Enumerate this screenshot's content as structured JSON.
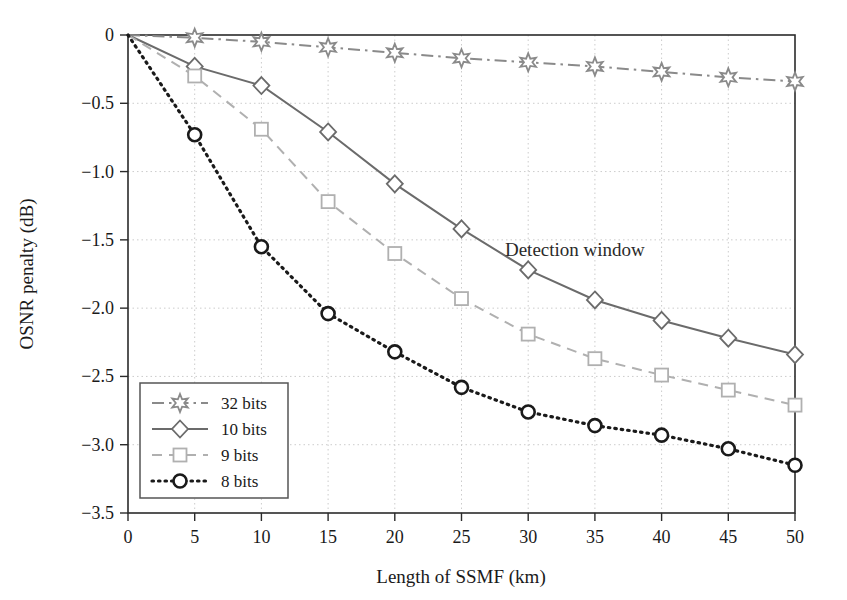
{
  "chart_data": {
    "type": "line",
    "title": "",
    "xlabel": "Length of SSMF (km)",
    "ylabel": "OSNR penalty (dB)",
    "xlim": [
      0,
      50
    ],
    "ylim": [
      -3.5,
      0
    ],
    "xticks": [
      "0",
      "5",
      "10",
      "15",
      "20",
      "25",
      "30",
      "35",
      "40",
      "45",
      "50"
    ],
    "yticks": [
      "0",
      "−0.5",
      "−1.0",
      "−1.5",
      "−2.0",
      "−2.5",
      "−3.0",
      "−3.5"
    ],
    "ytick_values": [
      0,
      -0.5,
      -1.0,
      -1.5,
      -2.0,
      -2.5,
      -3.0,
      -3.5
    ],
    "xtick_values": [
      0,
      5,
      10,
      15,
      20,
      25,
      30,
      35,
      40,
      45,
      50
    ],
    "grid": true,
    "legend_position": "lower-left",
    "x": [
      0,
      5,
      10,
      15,
      20,
      25,
      30,
      35,
      40,
      45,
      50
    ],
    "series": [
      {
        "name": "32 bits",
        "marker": "star",
        "linestyle": "dashdot",
        "color": "#8a8a8a",
        "values": [
          0,
          -0.02,
          -0.05,
          -0.09,
          -0.13,
          -0.17,
          -0.2,
          -0.23,
          -0.27,
          -0.31,
          -0.34
        ]
      },
      {
        "name": "10 bits",
        "marker": "diamond",
        "linestyle": "solid",
        "color": "#6b6b6b",
        "values": [
          0,
          -0.23,
          -0.37,
          -0.71,
          -1.09,
          -1.42,
          -1.72,
          -1.94,
          -2.09,
          -2.22,
          -2.34
        ]
      },
      {
        "name": "9 bits",
        "marker": "square",
        "linestyle": "dashed",
        "color": "#b0b0b0",
        "values": [
          0,
          -0.3,
          -0.69,
          -1.22,
          -1.6,
          -1.93,
          -2.19,
          -2.37,
          -2.49,
          -2.6,
          -2.71
        ]
      },
      {
        "name": "8 bits",
        "marker": "circle",
        "linestyle": "dotted",
        "color": "#1a1a1a",
        "values": [
          0,
          -0.73,
          -1.55,
          -2.04,
          -2.32,
          -2.58,
          -2.76,
          -2.86,
          -2.93,
          -3.03,
          -3.15
        ]
      }
    ],
    "annotations": [
      {
        "text": "Detection window",
        "x": 33.5,
        "y": -1.62
      }
    ]
  },
  "legend": {
    "items": [
      {
        "label": "32 bits"
      },
      {
        "label": "10 bits"
      },
      {
        "label": "9 bits"
      },
      {
        "label": "8 bits"
      }
    ]
  },
  "colors": {
    "axis": "#2b2b2b",
    "grid": "#cccccc",
    "background": "#ffffff"
  }
}
